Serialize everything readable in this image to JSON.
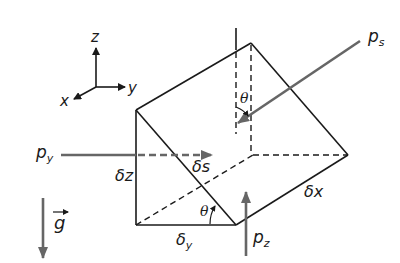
{
  "diagram": {
    "axes": {
      "x_label": "x",
      "y_label": "y",
      "z_label": "z"
    },
    "forces": {
      "ps_label": "p",
      "ps_sub": "s",
      "py_label": "p",
      "py_sub": "y",
      "pz_label": "p",
      "pz_sub": "z",
      "gravity_label": "g"
    },
    "dimensions": {
      "dz": "δz",
      "ds": "δs",
      "dx": "δx",
      "dy_delta": "δ",
      "dy_sub": "y"
    },
    "angles": {
      "theta_top": "θ",
      "theta_bottom": "θ"
    },
    "colors": {
      "edge": "#1a1a1a",
      "force_arrow": "#666666",
      "background": "#ffffff"
    }
  }
}
